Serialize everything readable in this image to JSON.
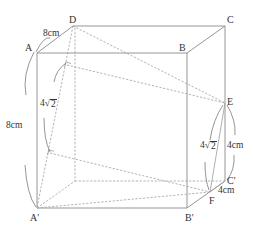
{
  "figure": {
    "type": "cube-diagram",
    "vertices": {
      "A": {
        "label": "A"
      },
      "B": {
        "label": "B"
      },
      "C": {
        "label": "C"
      },
      "D": {
        "label": "D"
      },
      "A_prime": {
        "label": "A'"
      },
      "B_prime": {
        "label": "B'"
      },
      "C_prime": {
        "label": "C'"
      },
      "E": {
        "label": "E"
      },
      "F": {
        "label": "F"
      }
    },
    "dimensions": {
      "AD": "8cm",
      "AA_prime": "8cm",
      "DA_prime_segment": {
        "coef": "4",
        "radicand": "2"
      },
      "EC_prime": "4cm",
      "EF_segment": {
        "coef": "4",
        "radicand": "2"
      },
      "C_prime_F": "4cm"
    },
    "colors": {
      "edge": "#8a8a8a",
      "hidden_edge": "#a0a0a0",
      "text": "#333333"
    }
  }
}
